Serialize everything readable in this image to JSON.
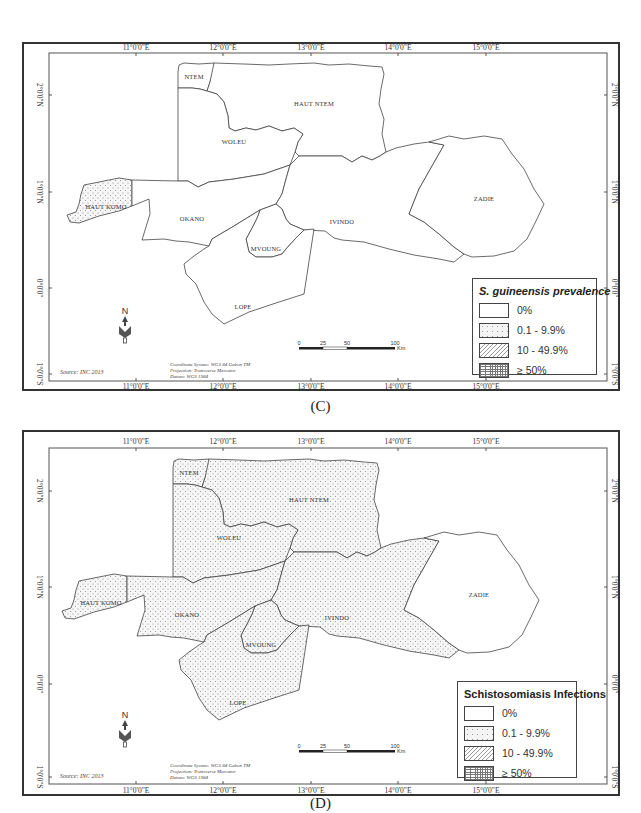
{
  "figure": {
    "panels": [
      {
        "id": "C",
        "caption": "(C)",
        "legend": {
          "title": "S. guineensis prevalence",
          "title_italic": true,
          "items": [
            {
              "label": "0%",
              "pattern": "none"
            },
            {
              "label": "0.1 - 9.9%",
              "pattern": "dots"
            },
            {
              "label": "10 - 49.9%",
              "pattern": "hatch"
            },
            {
              "label": "≥ 50%",
              "pattern": "grid"
            }
          ]
        },
        "regions": [
          {
            "name": "NTEM",
            "category": "0%"
          },
          {
            "name": "HAUT NTEM",
            "category": "0%"
          },
          {
            "name": "WOLEU",
            "category": "0%"
          },
          {
            "name": "HAUT KOMO",
            "category": "0.1 - 9.9%"
          },
          {
            "name": "OKANO",
            "category": "0%"
          },
          {
            "name": "IVINDO",
            "category": "0%"
          },
          {
            "name": "ZADIE",
            "category": "0%"
          },
          {
            "name": "MVOUNG",
            "category": "0%"
          },
          {
            "name": "LOPE",
            "category": "0%"
          }
        ]
      },
      {
        "id": "D",
        "caption": "(D)",
        "legend": {
          "title": "Schistosomiasis Infections",
          "title_italic": false,
          "items": [
            {
              "label": "0%",
              "pattern": "none"
            },
            {
              "label": "0.1 - 9.9%",
              "pattern": "dots"
            },
            {
              "label": "10 - 49.9%",
              "pattern": "hatch"
            },
            {
              "label": "≥ 50%",
              "pattern": "grid"
            }
          ]
        },
        "regions": [
          {
            "name": "NTEM",
            "category": "0.1 - 9.9%"
          },
          {
            "name": "HAUT NTEM",
            "category": "0.1 - 9.9%"
          },
          {
            "name": "WOLEU",
            "category": "0.1 - 9.9%"
          },
          {
            "name": "HAUT KOMO",
            "category": "0.1 - 9.9%"
          },
          {
            "name": "OKANO",
            "category": "0.1 - 9.9%"
          },
          {
            "name": "IVINDO",
            "category": "0.1 - 9.9%"
          },
          {
            "name": "ZADIE",
            "category": "0%"
          },
          {
            "name": "MVOUNG",
            "category": "0.1 - 9.9%"
          },
          {
            "name": "LOPE",
            "category": "0.1 - 9.9%"
          }
        ]
      }
    ],
    "axes": {
      "longitude_ticks": [
        "11°0'0\"E",
        "12°0'0\"E",
        "13°0'0\"E",
        "14°0'0\"E",
        "15°0'0\"E"
      ],
      "latitude_ticks": [
        "2°0'0\"N",
        "1°0'0\"N",
        "0°0'0\"",
        "1°0'0\"S"
      ]
    },
    "scale_bar": {
      "ticks": [
        "0",
        "25",
        "50",
        "100"
      ],
      "unit": "Km"
    },
    "north_arrow": "N",
    "source": "Source: INC 2013",
    "map_info": [
      "Coordinate System: WGS 84 Gabon TM",
      "Projection: Transverse Mercator",
      "Datum: WGS 1984"
    ],
    "region_labels": {
      "ntem": "NTEM",
      "haut_ntem": "HAUT NTEM",
      "woleu": "WOLEU",
      "haut_komo": "HAUT KOMO",
      "okano": "OKANO",
      "ivindo": "IVINDO",
      "zadie": "ZADIE",
      "mvoung": "MVOUNG",
      "lope": "LOPE"
    },
    "captions": {
      "c": "(C)",
      "d": "(D)"
    },
    "legend_c": {
      "title": "S. guineensis prevalence",
      "items": [
        "0%",
        "0.1 - 9.9%",
        "10 - 49.9%",
        "≥ 50%"
      ]
    },
    "legend_d": {
      "title": "Schistosomiasis Infections",
      "items": [
        "0%",
        "0.1 - 9.9%",
        "10 - 49.9%",
        "≥ 50%"
      ]
    }
  }
}
